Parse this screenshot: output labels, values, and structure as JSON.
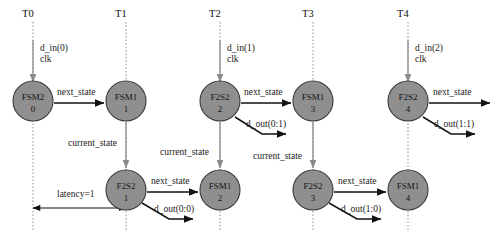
{
  "diagram": {
    "colors": {
      "node_fill": "#8f8f8f",
      "node_stroke": "#3a3a3a",
      "timeline": "#9a9a9a",
      "signal_arrow": "#8a8a8a",
      "transition_arrow": "#111111",
      "background": "#ffffff"
    },
    "timeline_ticks": [
      {
        "label": "T0",
        "x": 33
      },
      {
        "label": "T1",
        "x": 126
      },
      {
        "label": "T2",
        "x": 220
      },
      {
        "label": "T3",
        "x": 313
      },
      {
        "label": "T4",
        "x": 408
      }
    ],
    "input_signals": [
      {
        "data_label": "d_in(0)",
        "clock_label": "clk",
        "x": 33,
        "label_x": 40,
        "data_y": 51,
        "clock_y": 62,
        "line_from_y": 40,
        "line_to_y": 82
      },
      {
        "data_label": "d_in(1)",
        "clock_label": "clk",
        "x": 220,
        "label_x": 227,
        "data_y": 51,
        "clock_y": 62,
        "line_from_y": 40,
        "line_to_y": 82
      },
      {
        "data_label": "d_in(2)",
        "clock_label": "clk",
        "x": 408,
        "label_x": 415,
        "data_y": 51,
        "clock_y": 62,
        "line_from_y": 40,
        "line_to_y": 82
      }
    ],
    "nodes": [
      {
        "id": "n0",
        "name": "FSM2",
        "index": "0",
        "cx": 33,
        "cy": 101,
        "r": 20
      },
      {
        "id": "n1",
        "name": "FSM1",
        "index": "1",
        "cx": 126,
        "cy": 101,
        "r": 20
      },
      {
        "id": "n2",
        "name": "F2S2",
        "index": "2",
        "cx": 220,
        "cy": 101,
        "r": 20
      },
      {
        "id": "n3",
        "name": "FSM1",
        "index": "3",
        "cx": 313,
        "cy": 101,
        "r": 20
      },
      {
        "id": "n4",
        "name": "F2S2",
        "index": "4",
        "cx": 408,
        "cy": 101,
        "r": 20
      },
      {
        "id": "n5",
        "name": "F2S2",
        "index": "1",
        "cx": 126,
        "cy": 190,
        "r": 20
      },
      {
        "id": "n6",
        "name": "FSM1",
        "index": "2",
        "cx": 220,
        "cy": 190,
        "r": 20
      },
      {
        "id": "n7",
        "name": "F2S2",
        "index": "3",
        "cx": 313,
        "cy": 190,
        "r": 20
      },
      {
        "id": "n8",
        "name": "FSM1",
        "index": "4",
        "cx": 408,
        "cy": 190,
        "r": 20
      }
    ],
    "transitions": [
      {
        "label": "next_state",
        "label_x": 57,
        "label_y": 95,
        "x1": 54,
        "y1": 103,
        "x2": 104,
        "y2": 103
      },
      {
        "label": "next_state",
        "label_x": 244,
        "label_y": 95,
        "x1": 241,
        "y1": 103,
        "x2": 291,
        "y2": 103
      },
      {
        "label": "next_state",
        "label_x": 433,
        "label_y": 95,
        "x1": 429,
        "y1": 103,
        "x2": 490,
        "y2": 103
      },
      {
        "label": "next_state",
        "label_x": 151,
        "label_y": 184,
        "x1": 147,
        "y1": 192,
        "x2": 198,
        "y2": 192
      },
      {
        "label": "next_state",
        "label_x": 338,
        "label_y": 184,
        "x1": 334,
        "y1": 192,
        "x2": 386,
        "y2": 192
      }
    ],
    "outputs": [
      {
        "label": "d_out(0:1)",
        "label_x": 246,
        "label_y": 127,
        "x1": 235,
        "y1": 117,
        "x2": 262,
        "y2": 134
      },
      {
        "label": "d_out(1:1)",
        "label_x": 434,
        "label_y": 127,
        "x1": 423,
        "y1": 117,
        "x2": 451,
        "y2": 134
      },
      {
        "label": "d_out(0:0)",
        "label_x": 154,
        "label_y": 212,
        "x1": 142,
        "y1": 203,
        "x2": 169,
        "y2": 219
      },
      {
        "label": "d_out(1:0)",
        "label_x": 341,
        "label_y": 212,
        "x1": 329,
        "y1": 203,
        "x2": 357,
        "y2": 219
      }
    ],
    "state_feedbacks": [
      {
        "label": "current_state",
        "label_x": 68,
        "label_y": 146,
        "x": 126,
        "y1": 122,
        "y2": 168
      },
      {
        "label": "current_state",
        "label_x": 160,
        "label_y": 155,
        "x": 220,
        "y1": 122,
        "y2": 168
      },
      {
        "label": "current_state",
        "label_x": 253,
        "label_y": 159,
        "x": 313,
        "y1": 122,
        "y2": 168
      }
    ],
    "latency": {
      "label": "latency=1",
      "label_x": 57,
      "label_y": 197,
      "x1": 33,
      "x2": 126,
      "y": 208
    }
  }
}
